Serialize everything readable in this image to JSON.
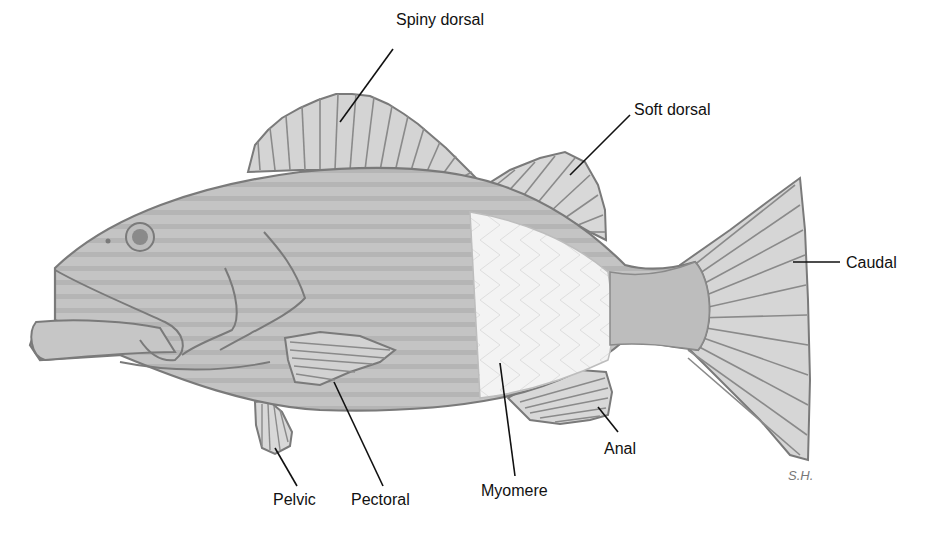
{
  "diagram": {
    "labels": {
      "spiny_dorsal": "Spiny dorsal",
      "soft_dorsal": "Soft dorsal",
      "caudal": "Caudal",
      "anal": "Anal",
      "myomere": "Myomere",
      "pectoral": "Pectoral",
      "pelvic": "Pelvic"
    },
    "signature": "S.H.",
    "colors": {
      "outline": "#7a7a7a",
      "body_fill": "#c9c9c9",
      "myomere_fill": "#f1f1f1",
      "fin_fill": "#d9d9d9",
      "leader_line": "#111111",
      "label_text": "#111111"
    }
  }
}
